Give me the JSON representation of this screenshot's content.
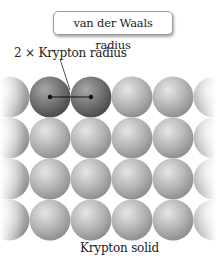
{
  "diagram": {
    "title_box": "van der Waals radius",
    "radius_label": "2 × Krypton radius",
    "caption": "Krypton solid",
    "lattice": {
      "rows": 4,
      "columns": 4,
      "row_y": [
        97,
        138,
        179,
        220
      ],
      "column_x": [
        50,
        91,
        132,
        173
      ],
      "sphere_radius": 20.5,
      "highlighted_spheres": [
        [
          0,
          0
        ],
        [
          0,
          1
        ]
      ],
      "colors": {
        "sphere": "#b4b4b4",
        "highlight": "#7a7a7a"
      }
    },
    "measurement_line": {
      "from": [
        50,
        97
      ],
      "to": [
        91,
        97
      ]
    }
  }
}
